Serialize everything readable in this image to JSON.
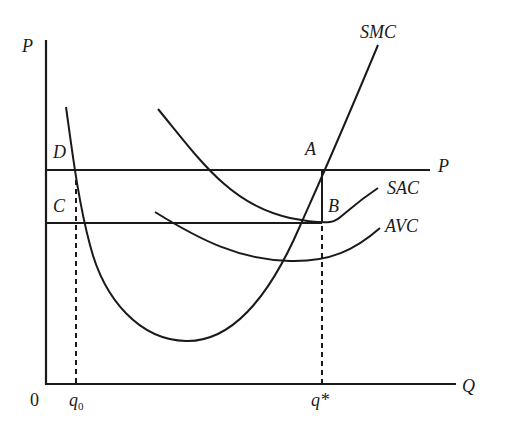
{
  "diagram": {
    "type": "economics-cost-curves",
    "axes": {
      "y_label": "P",
      "x_label": "Q",
      "origin_label": "0"
    },
    "x_ticks": {
      "q0": {
        "label": "q",
        "subscript": "0"
      },
      "qstar": {
        "label": "q*"
      }
    },
    "curves": {
      "smc": {
        "label": "SMC"
      },
      "sac": {
        "label": "SAC"
      },
      "avc": {
        "label": "AVC"
      },
      "price_line": {
        "label": "P"
      }
    },
    "points": {
      "a": {
        "label": "A"
      },
      "b": {
        "label": "B"
      },
      "c": {
        "label": "C"
      },
      "d": {
        "label": "D"
      }
    },
    "colors": {
      "ink": "#1a1a1a",
      "background": "#ffffff"
    }
  }
}
